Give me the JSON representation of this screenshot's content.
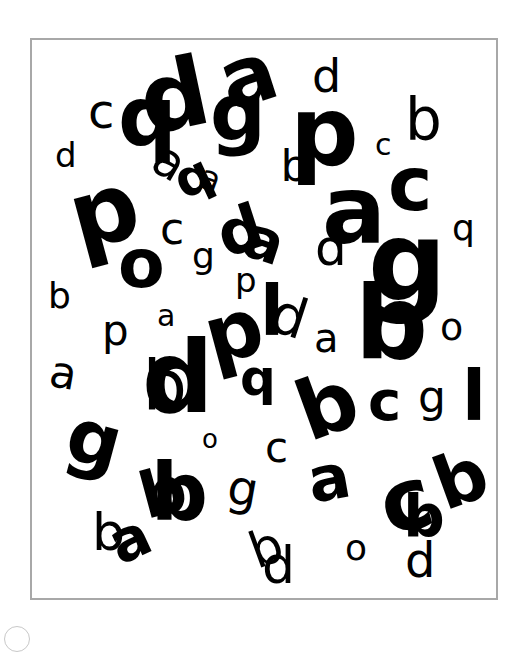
{
  "stimulus": {
    "frame": {
      "x": 30,
      "y": 38,
      "width": 468,
      "height": 562,
      "border_color": "#a8a8a8"
    },
    "letter_color": "#000000",
    "letters": [
      {
        "ch": "c",
        "x": 88,
        "y": 128,
        "size": 48,
        "rot": 0,
        "w": "normal"
      },
      {
        "ch": "d",
        "x": 55,
        "y": 167,
        "size": 34,
        "rot": 0,
        "w": "normal"
      },
      {
        "ch": "q",
        "x": 118,
        "y": 145,
        "size": 82,
        "rot": 0,
        "w": "bold"
      },
      {
        "ch": "d",
        "x": 140,
        "y": 130,
        "size": 95,
        "rot": -12,
        "w": "bold"
      },
      {
        "ch": "a",
        "x": 155,
        "y": 178,
        "size": 48,
        "rot": 30,
        "w": "normal"
      },
      {
        "ch": "q",
        "x": 175,
        "y": 195,
        "size": 50,
        "rot": -25,
        "w": "bold"
      },
      {
        "ch": "a",
        "x": 200,
        "y": 190,
        "size": 34,
        "rot": 20,
        "w": "normal"
      },
      {
        "ch": "a",
        "x": 220,
        "y": 105,
        "size": 82,
        "rot": -18,
        "w": "bold"
      },
      {
        "ch": "g",
        "x": 210,
        "y": 140,
        "size": 78,
        "rot": 0,
        "w": "bold"
      },
      {
        "ch": "d",
        "x": 312,
        "y": 92,
        "size": 46,
        "rot": 0,
        "w": "normal"
      },
      {
        "ch": "p",
        "x": 290,
        "y": 165,
        "size": 96,
        "rot": 0,
        "w": "bold"
      },
      {
        "ch": "q",
        "x": 282,
        "y": 188,
        "size": 44,
        "rot": 180,
        "w": "normal"
      },
      {
        "ch": "c",
        "x": 375,
        "y": 155,
        "size": 30,
        "rot": 0,
        "w": "normal"
      },
      {
        "ch": "b",
        "x": 405,
        "y": 140,
        "size": 58,
        "rot": 0,
        "w": "normal"
      },
      {
        "ch": "p",
        "x": 70,
        "y": 245,
        "size": 95,
        "rot": -15,
        "w": "bold"
      },
      {
        "ch": "o",
        "x": 118,
        "y": 287,
        "size": 68,
        "rot": 0,
        "w": "bold"
      },
      {
        "ch": "c",
        "x": 160,
        "y": 244,
        "size": 44,
        "rot": 0,
        "w": "normal"
      },
      {
        "ch": "g",
        "x": 192,
        "y": 268,
        "size": 36,
        "rot": 0,
        "w": "normal"
      },
      {
        "ch": "d",
        "x": 218,
        "y": 253,
        "size": 62,
        "rot": -18,
        "w": "bold"
      },
      {
        "ch": "a",
        "x": 245,
        "y": 260,
        "size": 58,
        "rot": 18,
        "w": "bold"
      },
      {
        "ch": "a",
        "x": 322,
        "y": 243,
        "size": 95,
        "rot": 0,
        "w": "bold"
      },
      {
        "ch": "d",
        "x": 315,
        "y": 265,
        "size": 50,
        "rot": 0,
        "w": "normal"
      },
      {
        "ch": "c",
        "x": 388,
        "y": 210,
        "size": 75,
        "rot": 0,
        "w": "bold"
      },
      {
        "ch": "q",
        "x": 452,
        "y": 240,
        "size": 36,
        "rot": 0,
        "w": "normal"
      },
      {
        "ch": "b",
        "x": 48,
        "y": 308,
        "size": 36,
        "rot": 0,
        "w": "normal"
      },
      {
        "ch": "p",
        "x": 235,
        "y": 292,
        "size": 34,
        "rot": 0,
        "w": "normal"
      },
      {
        "ch": "l",
        "x": 260,
        "y": 335,
        "size": 70,
        "rot": 0,
        "w": "bold"
      },
      {
        "ch": "d",
        "x": 272,
        "y": 335,
        "size": 55,
        "rot": 18,
        "w": "normal"
      },
      {
        "ch": "g",
        "x": 368,
        "y": 300,
        "size": 110,
        "rot": 0,
        "w": "bold"
      },
      {
        "ch": "b",
        "x": 355,
        "y": 358,
        "size": 102,
        "rot": 0,
        "w": "bold"
      },
      {
        "ch": "a",
        "x": 314,
        "y": 352,
        "size": 40,
        "rot": 0,
        "w": "normal"
      },
      {
        "ch": "o",
        "x": 440,
        "y": 340,
        "size": 38,
        "rot": 0,
        "w": "normal"
      },
      {
        "ch": "p",
        "x": 102,
        "y": 345,
        "size": 42,
        "rot": 0,
        "w": "normal"
      },
      {
        "ch": "a",
        "x": 157,
        "y": 326,
        "size": 30,
        "rot": 0,
        "w": "normal"
      },
      {
        "ch": "p",
        "x": 205,
        "y": 360,
        "size": 80,
        "rot": -15,
        "w": "bold"
      },
      {
        "ch": "a",
        "x": 50,
        "y": 388,
        "size": 44,
        "rot": 10,
        "w": "normal"
      },
      {
        "ch": "d",
        "x": 142,
        "y": 412,
        "size": 100,
        "rot": 0,
        "w": "bold"
      },
      {
        "ch": "q",
        "x": 145,
        "y": 420,
        "size": 70,
        "rot": 180,
        "w": "normal"
      },
      {
        "ch": "q",
        "x": 240,
        "y": 395,
        "size": 50,
        "rot": 0,
        "w": "bold"
      },
      {
        "ch": "b",
        "x": 298,
        "y": 435,
        "size": 82,
        "rot": -20,
        "w": "bold"
      },
      {
        "ch": "c",
        "x": 368,
        "y": 420,
        "size": 56,
        "rot": 0,
        "w": "bold"
      },
      {
        "ch": "g",
        "x": 418,
        "y": 412,
        "size": 44,
        "rot": 0,
        "w": "normal"
      },
      {
        "ch": "l",
        "x": 462,
        "y": 420,
        "size": 70,
        "rot": 0,
        "w": "bold"
      },
      {
        "ch": "o",
        "x": 202,
        "y": 448,
        "size": 26,
        "rot": 0,
        "w": "normal"
      },
      {
        "ch": "c",
        "x": 265,
        "y": 462,
        "size": 42,
        "rot": 0,
        "w": "normal"
      },
      {
        "ch": "g",
        "x": 68,
        "y": 464,
        "size": 75,
        "rot": 15,
        "w": "bold"
      },
      {
        "ch": "b",
        "x": 140,
        "y": 515,
        "size": 64,
        "rot": -15,
        "w": "bold"
      },
      {
        "ch": "q",
        "x": 160,
        "y": 532,
        "size": 80,
        "rot": 180,
        "w": "bold"
      },
      {
        "ch": "g",
        "x": 228,
        "y": 505,
        "size": 48,
        "rot": 10,
        "w": "normal"
      },
      {
        "ch": "a",
        "x": 308,
        "y": 500,
        "size": 62,
        "rot": -10,
        "w": "bold"
      },
      {
        "ch": "c",
        "x": 380,
        "y": 530,
        "size": 86,
        "rot": -15,
        "w": "bold"
      },
      {
        "ch": "b",
        "x": 435,
        "y": 505,
        "size": 72,
        "rot": -20,
        "w": "bold"
      },
      {
        "ch": "b",
        "x": 92,
        "y": 550,
        "size": 52,
        "rot": 0,
        "w": "normal"
      },
      {
        "ch": "a",
        "x": 110,
        "y": 560,
        "size": 58,
        "rot": -25,
        "w": "bold"
      },
      {
        "ch": "o",
        "x": 345,
        "y": 560,
        "size": 36,
        "rot": 0,
        "w": "normal"
      },
      {
        "ch": "q",
        "x": 410,
        "y": 545,
        "size": 58,
        "rot": 180,
        "w": "bold"
      },
      {
        "ch": "d",
        "x": 405,
        "y": 577,
        "size": 48,
        "rot": 0,
        "w": "normal"
      },
      {
        "ch": "b",
        "x": 250,
        "y": 565,
        "size": 50,
        "rot": -20,
        "w": "normal"
      },
      {
        "ch": "d",
        "x": 262,
        "y": 583,
        "size": 52,
        "rot": 0,
        "w": "normal"
      }
    ]
  }
}
